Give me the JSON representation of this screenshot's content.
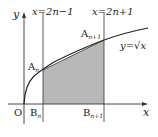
{
  "diagram": {
    "axes": {
      "x_label": "x",
      "y_label": "y",
      "origin_label": "O"
    },
    "lines": {
      "left": {
        "equation": "x=2n−1"
      },
      "right": {
        "equation": "x=2n+1"
      }
    },
    "curve": {
      "equation": "y=√x"
    },
    "points": {
      "A_n": {
        "base": "A",
        "sub": "n"
      },
      "A_n1": {
        "base": "A",
        "sub": "n+1"
      },
      "B_n": {
        "base": "B",
        "sub": "n"
      },
      "B_n1": {
        "base": "B",
        "sub": "n+1"
      }
    },
    "colors": {
      "shade": "#b8b8b8",
      "line": "#333333"
    }
  }
}
